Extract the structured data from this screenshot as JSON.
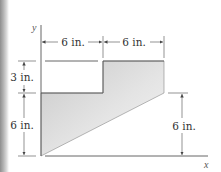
{
  "figure": {
    "axis_labels": {
      "x": "x",
      "y": "y"
    },
    "dimensions": {
      "top_left_width": "6 in.",
      "top_right_width": "6 in.",
      "left_upper_height": "3 in.",
      "left_lower_height": "6 in.",
      "right_height": "6 in."
    },
    "colors": {
      "fill_light": "#f1f1f1",
      "fill_dark": "#c9c9c9",
      "line": "#555555",
      "edge_strip": "#8e8e8e"
    }
  }
}
